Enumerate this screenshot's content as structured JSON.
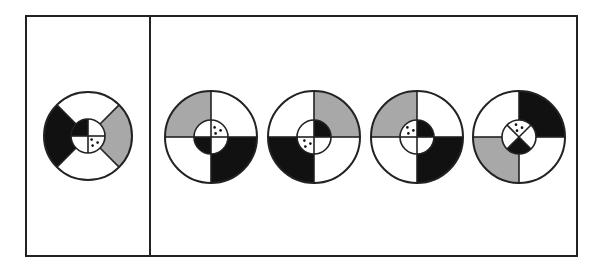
{
  "puzzle": {
    "type": "figure-reasoning",
    "frame": {
      "x": 26,
      "y": 16,
      "width": 551,
      "height": 240,
      "divider_x": 150
    },
    "colors": {
      "black": "#111111",
      "gray": "#a8a8a8",
      "white": "#ffffff",
      "stroke": "#222222"
    },
    "question_figure": {
      "id": "given",
      "cx": 88,
      "cy": 136,
      "r": 44,
      "ri": 17,
      "outer_division": "x",
      "outer": {
        "top": "white",
        "right": "gray",
        "bottom": "white",
        "left": "black"
      },
      "inner_division": "plus",
      "inner": {
        "tl": "black",
        "tr": "white",
        "bl": "white",
        "br": "white"
      },
      "dots_in": "br"
    },
    "options": [
      {
        "id": "option-1",
        "cx": 211,
        "cy": 137,
        "r": 46,
        "ri": 17,
        "outer_division": "plus",
        "outer": {
          "tl": "gray",
          "tr": "white",
          "bl": "white",
          "br": "black"
        },
        "inner_division": "plus",
        "inner": {
          "tl": "white",
          "tr": "white",
          "bl": "black",
          "br": "white"
        },
        "dots_in": "tr"
      },
      {
        "id": "option-2",
        "cx": 314,
        "cy": 137,
        "r": 46,
        "ri": 17,
        "outer_division": "plus",
        "outer": {
          "tl": "white",
          "tr": "gray",
          "bl": "black",
          "br": "white"
        },
        "inner_division": "plus",
        "inner": {
          "tl": "white",
          "tr": "black",
          "bl": "white",
          "br": "white"
        },
        "dots_in": "bl"
      },
      {
        "id": "option-3",
        "cx": 417,
        "cy": 137,
        "r": 46,
        "ri": 17,
        "outer_division": "plus",
        "outer": {
          "tl": "gray",
          "tr": "white",
          "bl": "white",
          "br": "black"
        },
        "inner_division": "plus",
        "inner": {
          "tl": "white",
          "tr": "black",
          "bl": "white",
          "br": "white"
        },
        "dots_in": "tl"
      },
      {
        "id": "option-4",
        "cx": 519,
        "cy": 137,
        "r": 46,
        "ri": 17,
        "outer_division": "plus",
        "outer": {
          "tl": "white",
          "tr": "black",
          "bl": "gray",
          "br": "white"
        },
        "inner_division": "x",
        "inner": {
          "top": "white",
          "right": "white",
          "bottom": "black",
          "left": "white"
        },
        "dots_in": "top"
      }
    ]
  }
}
